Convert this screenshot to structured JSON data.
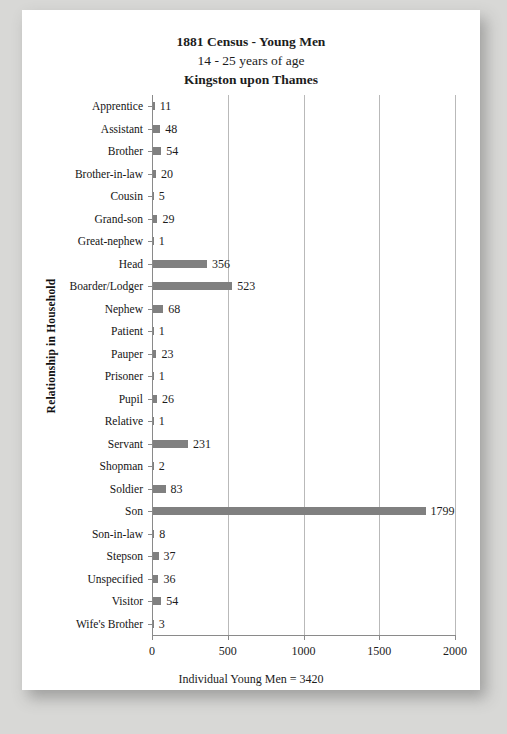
{
  "page": {
    "faint_footer_text": " "
  },
  "titles": {
    "line1": "1881 Census - Young Men",
    "line2": "14 - 25 years of age",
    "line3": "Kingston upon Thames"
  },
  "axes": {
    "y_title": "Relationship in Household",
    "x_title": "Individual Young Men = 3420"
  },
  "colors": {
    "bar": "#808080",
    "gridline": "#b9b9b9",
    "axis": "#8a8a8a",
    "page_background": "#ffffff",
    "canvas_background": "#d8d8d6",
    "text": "#1c1c1c"
  },
  "chart_data": {
    "type": "bar",
    "orientation": "horizontal",
    "title": "1881 Census - Young Men 14 - 25 years of age Kingston upon Thames",
    "xlabel": "Individual Young Men = 3420",
    "ylabel": "Relationship in Household",
    "xlim": [
      0,
      2000
    ],
    "xticks": [
      0,
      500,
      1000,
      1500,
      2000
    ],
    "xtick_labels": [
      "0",
      "500",
      "1000",
      "1500",
      "2000"
    ],
    "grid": true,
    "grid_axis": "x",
    "legend": false,
    "data_labels": true,
    "total": 3420,
    "categories": [
      "Apprentice",
      "Assistant",
      "Brother",
      "Brother-in-law",
      "Cousin",
      "Grand-son",
      "Great-nephew",
      "Head",
      "Boarder/Lodger",
      "Nephew",
      "Patient",
      "Pauper",
      "Prisoner",
      "Pupil",
      "Relative",
      "Servant",
      "Shopman",
      "Soldier",
      "Son",
      "Son-in-law",
      "Stepson",
      "Unspecified",
      "Visitor",
      "Wife's Brother"
    ],
    "values": [
      11,
      48,
      54,
      20,
      5,
      29,
      1,
      356,
      523,
      68,
      1,
      23,
      1,
      26,
      1,
      231,
      2,
      83,
      1799,
      8,
      37,
      36,
      54,
      3
    ],
    "value_labels": [
      "11",
      "48",
      "54",
      "20",
      "5",
      "29",
      "1",
      "356",
      "523",
      "68",
      "1",
      "23",
      "1",
      "26",
      "1",
      "231",
      "2",
      "83",
      "1799",
      "8",
      "37",
      "36",
      "54",
      "3"
    ]
  }
}
